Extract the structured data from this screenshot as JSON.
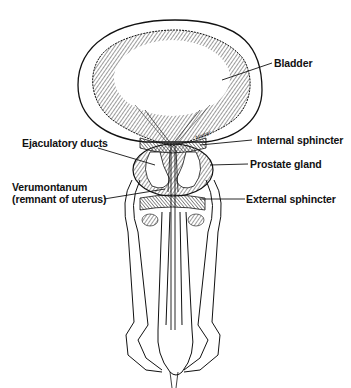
{
  "diagram": {
    "style": "black ink illustration on white background",
    "labels": [
      {
        "id": "bladder",
        "text": "Bladder",
        "side": "right"
      },
      {
        "id": "internal-sphincter",
        "text": "Internal sphincter",
        "side": "right"
      },
      {
        "id": "prostate-gland",
        "text": "Prostate gland",
        "side": "right"
      },
      {
        "id": "external-sphincter",
        "text": "External sphincter",
        "side": "right"
      },
      {
        "id": "ejaculatory-ducts",
        "text": "Ejaculatory ducts",
        "side": "left"
      },
      {
        "id": "verumontanum",
        "text": "Verumontanum",
        "side": "left"
      },
      {
        "id": "verumontanum-note",
        "text": "(remnant of uterus)",
        "side": "left"
      }
    ],
    "colors": {
      "ink": "#111111",
      "background": "#ffffff",
      "shading": "#555555"
    }
  }
}
